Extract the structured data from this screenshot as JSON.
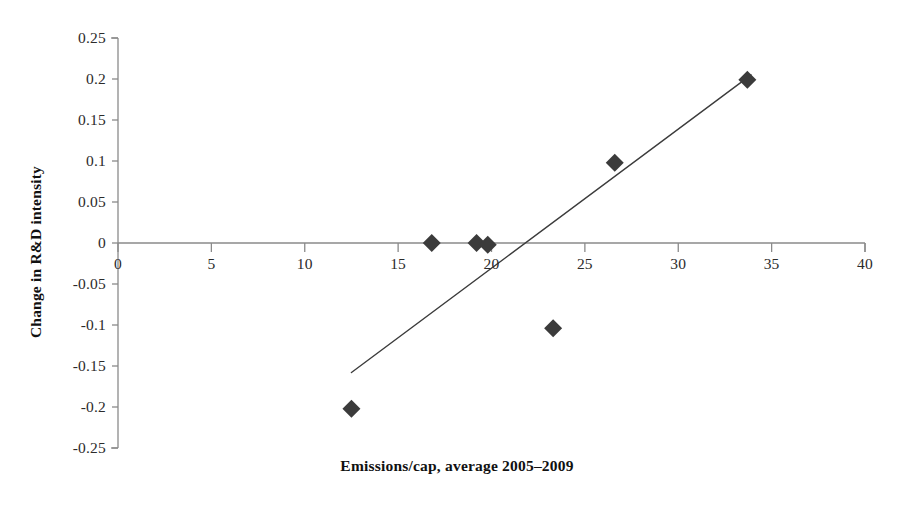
{
  "chart_data": {
    "type": "scatter",
    "title": "",
    "xlabel": "Emissions/cap, average 2005–2009",
    "ylabel": "Change in R&D intensity",
    "xlim": [
      0,
      40
    ],
    "ylim": [
      -0.25,
      0.25
    ],
    "xticks": [
      0,
      5,
      10,
      15,
      20,
      25,
      30,
      35,
      40
    ],
    "xtick_labels": [
      "0",
      "5",
      "10",
      "15",
      "20",
      "25",
      "30",
      "35",
      "40"
    ],
    "yticks": [
      0.25,
      0.2,
      0.15,
      0.1,
      0.05,
      0,
      -0.05,
      -0.1,
      -0.15,
      -0.2,
      -0.25
    ],
    "ytick_labels": [
      "0.25",
      "0.2",
      "0.15",
      "0.1",
      "0.05",
      "0",
      "-0.05",
      "-0.1",
      "-0.15",
      "-0.2",
      "-0.25"
    ],
    "grid": false,
    "legend": false,
    "legend_position": "none",
    "marker": "diamond",
    "marker_color": "#3b3b3b",
    "marker_size": 9,
    "axis_color": "#8a8a8a",
    "text_color": "#1a1a1a",
    "background": "#ffffff",
    "series": [
      {
        "name": "Countries",
        "points": [
          {
            "x": 12.5,
            "y": -0.202
          },
          {
            "x": 16.8,
            "y": 0.0
          },
          {
            "x": 19.2,
            "y": 0.0
          },
          {
            "x": 19.8,
            "y": -0.002
          },
          {
            "x": 23.3,
            "y": -0.104
          },
          {
            "x": 26.6,
            "y": 0.098
          },
          {
            "x": 33.7,
            "y": 0.199
          }
        ]
      }
    ],
    "trendline": {
      "name": "Linear trendline",
      "color": "#3c3c3c",
      "width": 1.4,
      "x_start": 12.5,
      "y_start": -0.158,
      "x_end": 33.9,
      "y_end": 0.205,
      "slope": 0.01697,
      "intercept": -0.3702
    }
  },
  "axes": {
    "x_title": "Emissions/cap, average 2005–2009",
    "y_title": "Change in R&D intensity"
  }
}
